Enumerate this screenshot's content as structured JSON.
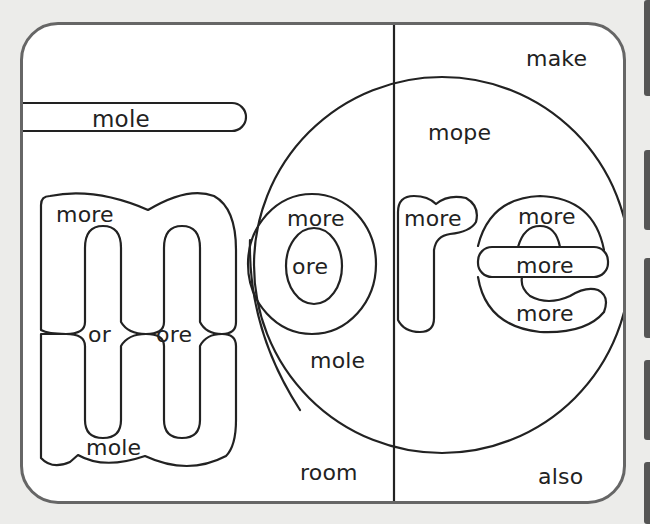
{
  "worksheet": {
    "theme_word": "more",
    "colors": {
      "background": "#ececea",
      "card_border": "#666666",
      "line": "#222222",
      "text": "#222222"
    },
    "words": {
      "top_bar": "mole",
      "m_top_left": "more",
      "m_middle_left": "or",
      "m_middle_right": "ore",
      "m_bottom": "mole",
      "o_outer": "more",
      "o_inner": "ore",
      "circle_mole": "mole",
      "circle_mope": "mope",
      "r_top": "more",
      "e_top": "more",
      "e_bar": "more",
      "e_bottom": "more",
      "corner_top_right": "make",
      "bottom_left_column": "room",
      "bottom_right": "also"
    }
  }
}
